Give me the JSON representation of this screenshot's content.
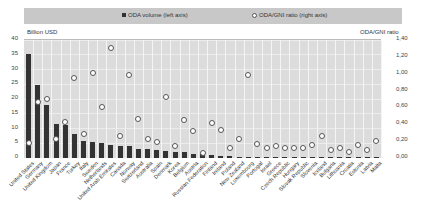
{
  "chart_data": {
    "type": "bar",
    "title": "",
    "legend": [
      {
        "label": "ODA volume (left axis)",
        "marker": "bar",
        "color": "#333333"
      },
      {
        "label": "ODA/GNI ratio (right axis)",
        "marker": "circle",
        "color": "#ffffff"
      }
    ],
    "legend_position": "top",
    "left_axis_label": "Billion USD",
    "right_axis_label": "ODA/GNI ratio",
    "left_ylim": [
      0,
      40
    ],
    "right_ylim": [
      0,
      1.4
    ],
    "left_ticks": [
      "0",
      "5",
      "10",
      "15",
      "20",
      "25",
      "30",
      "35",
      "40"
    ],
    "right_ticks": [
      "0,00",
      "0,20",
      "0,40",
      "0,60",
      "0,80",
      "1,00",
      "1,20",
      "1,40"
    ],
    "grid": true,
    "categories": [
      "United States",
      "Germany",
      "United Kingdom",
      "Japan",
      "France",
      "Turkey",
      "Italy",
      "Sweden",
      "Netherlands",
      "United Arab Emirates",
      "Canada",
      "Norway",
      "Switzerland",
      "Australia",
      "Spain",
      "Denmark",
      "Korea",
      "Belgium",
      "Austria",
      "Russian Federation",
      "Finland",
      "Ireland",
      "Poland",
      "New Zealand",
      "Luxembourg",
      "Portugal",
      "Israel",
      "Greece",
      "Czech Republic",
      "Hungary",
      "Slovak Republic",
      "Slovenia",
      "Iceland",
      "Bulgaria",
      "Lithuania",
      "Croatia",
      "Estonia",
      "Latvia",
      "Malta"
    ],
    "series": [
      {
        "name": "ODA volume (left axis)",
        "axis": "left",
        "type": "bar",
        "values": [
          35.3,
          24.7,
          18.0,
          11.5,
          11.3,
          8.1,
          5.7,
          5.5,
          5.0,
          4.4,
          4.1,
          4.1,
          3.1,
          3.0,
          2.6,
          2.4,
          2.2,
          2.2,
          1.2,
          1.2,
          0.9,
          0.8,
          0.7,
          0.4,
          0.4,
          0.4,
          0.2,
          0.3,
          0.3,
          0.2,
          0.1,
          0.1,
          0.1,
          0.05,
          0.06,
          0.05,
          0.05,
          0.03,
          0.02
        ]
      },
      {
        "name": "ODA/GNI ratio (right axis)",
        "axis": "right",
        "type": "scatter",
        "values": [
          0.18,
          0.66,
          0.7,
          0.23,
          0.43,
          0.95,
          0.29,
          1.01,
          0.6,
          1.31,
          0.26,
          0.99,
          0.46,
          0.23,
          0.19,
          0.72,
          0.14,
          0.45,
          0.32,
          0.06,
          0.42,
          0.33,
          0.12,
          0.23,
          0.98,
          0.17,
          0.12,
          0.14,
          0.12,
          0.12,
          0.12,
          0.15,
          0.26,
          0.09,
          0.12,
          0.07,
          0.15,
          0.09,
          0.2
        ]
      }
    ]
  }
}
